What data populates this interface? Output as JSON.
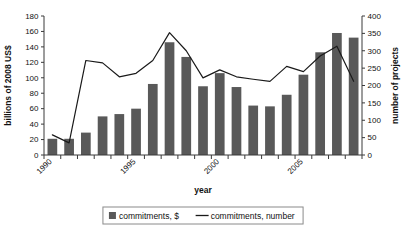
{
  "chart_data": {
    "type": "bar",
    "title": "",
    "xlabel": "year",
    "ylabel": "billions of 2008 US$",
    "y2label": "number of projects",
    "ylim": [
      0,
      180
    ],
    "y2lim": [
      0,
      400
    ],
    "ytick_values": [
      0,
      20,
      40,
      60,
      80,
      100,
      120,
      140,
      160,
      180
    ],
    "y2tick_values": [
      0,
      50,
      100,
      150,
      200,
      250,
      300,
      350,
      400
    ],
    "grid": false,
    "legend_position": "bottom",
    "categories": [
      "1990",
      "1991",
      "1992",
      "1993",
      "1994",
      "1995",
      "1996",
      "1997",
      "1998",
      "1999",
      "2000",
      "2001",
      "2002",
      "2003",
      "2004",
      "2005",
      "2006",
      "2007",
      "2008"
    ],
    "xtick_labels_shown": [
      "1990",
      "1995",
      "2000",
      "2005"
    ],
    "series": [
      {
        "name": "commitments, $",
        "type": "bar",
        "axis": "left",
        "units": "billions of 2008 US$",
        "color": "#595959",
        "values": [
          21,
          21,
          29,
          50,
          53,
          60,
          92,
          146,
          127,
          89,
          106,
          88,
          64,
          63,
          78,
          104,
          133,
          158,
          152
        ]
      },
      {
        "name": "commitments, number",
        "type": "line",
        "axis": "right",
        "units": "number of projects",
        "color": "#1a1a1a",
        "values": [
          58,
          35,
          272,
          265,
          225,
          235,
          272,
          352,
          300,
          222,
          245,
          225,
          218,
          212,
          255,
          240,
          285,
          313,
          212
        ]
      }
    ]
  },
  "legend": {
    "entries": [
      {
        "label": "commitments, $",
        "marker": "square"
      },
      {
        "label": "commitments, number",
        "marker": "line"
      }
    ]
  },
  "axes": {
    "left_title": "billions of 2008 US$",
    "right_title": "number of projects",
    "bottom_title": "year"
  }
}
